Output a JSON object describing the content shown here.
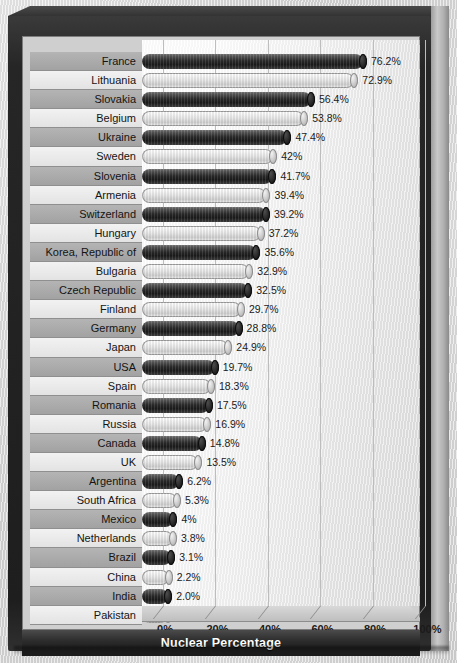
{
  "chart_data": {
    "type": "bar",
    "orientation": "horizontal",
    "title": "",
    "xlabel": "Nuclear Percentage",
    "ylabel": "",
    "xlim": [
      0,
      100
    ],
    "xticks": [
      "0%",
      "20%",
      "40%",
      "60%",
      "80%",
      "100%"
    ],
    "xtick_values": [
      0,
      20,
      40,
      60,
      80,
      100
    ],
    "grid": true,
    "legend": "none",
    "categories": [
      "France",
      "Lithuania",
      "Slovakia",
      "Belgium",
      "Ukraine",
      "Sweden",
      "Slovenia",
      "Armenia",
      "Switzerland",
      "Hungary",
      "Korea, Republic of",
      "Bulgaria",
      "Czech Republic",
      "Finland",
      "Germany",
      "Japan",
      "USA",
      "Spain",
      "Romania",
      "Russia",
      "Canada",
      "UK",
      "Argentina",
      "South Africa",
      "Mexico",
      "Netherlands",
      "Brazil",
      "China",
      "India",
      "Pakistan"
    ],
    "values": [
      76.2,
      72.9,
      56.4,
      53.8,
      47.4,
      42,
      41.7,
      39.4,
      39.2,
      37.2,
      35.6,
      32.9,
      32.5,
      29.7,
      28.8,
      24.9,
      19.7,
      18.3,
      17.5,
      16.9,
      14.8,
      13.5,
      6.2,
      5.3,
      4,
      3.8,
      3.1,
      2.2,
      2.0,
      1.9
    ],
    "data_labels": [
      "76.2%",
      "72.9%",
      "56.4%",
      "53.8%",
      "47.4%",
      "42%",
      "41.7%",
      "39.4%",
      "39.2%",
      "37.2%",
      "35.6%",
      "32.9%",
      "32.5%",
      "29.7%",
      "28.8%",
      "24.9%",
      "19.7%",
      "18.3%",
      "17.5%",
      "16.9%",
      "14.8%",
      "13.5%",
      "6.2%",
      "5.3%",
      "4%",
      "3.8%",
      "3.1%",
      "2.2%",
      "2.0%",
      "1.9%"
    ]
  },
  "axis_title": {
    "text": "Nuclear Percentage"
  },
  "colors": {
    "bar_dark": "#2b2b2b",
    "bar_light": "#e9e9e9",
    "label_band_dark": "#a2a2a2",
    "label_band_light": "#e3e3e3",
    "frame": "#1e1e1e",
    "plot_background": "#f2f2f2",
    "gridline": "#bdbdbd",
    "title_bar": "#1c1c1c",
    "title_text": "#ffffff"
  }
}
